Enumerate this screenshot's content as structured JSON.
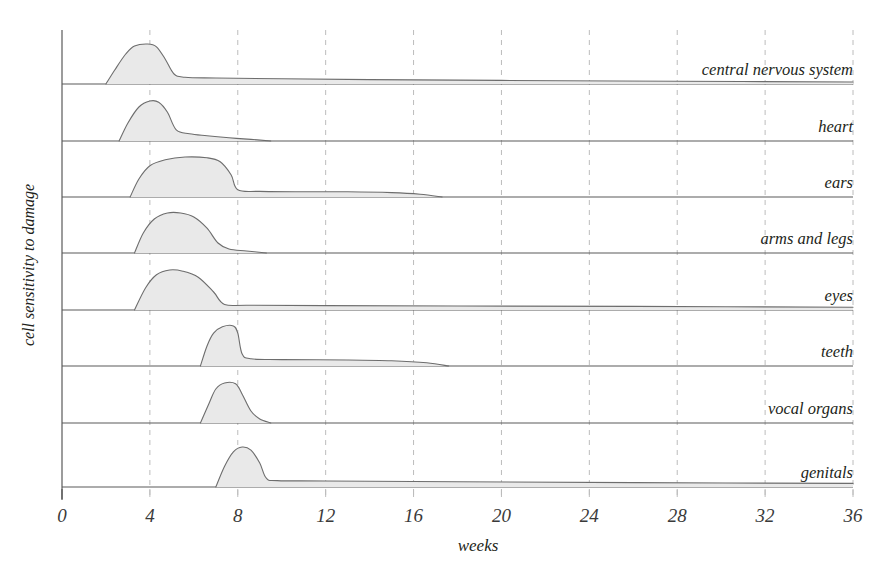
{
  "chart_data": {
    "type": "area",
    "title": "",
    "xlabel": "weeks",
    "ylabel": "cell sensitivity to damage",
    "xlim": [
      0,
      36
    ],
    "xticks": [
      0,
      4,
      8,
      12,
      16,
      20,
      24,
      28,
      32,
      36
    ],
    "xtick_labels": [
      "0",
      "4",
      "8",
      "12",
      "16",
      "20",
      "24",
      "28",
      "32",
      "36"
    ],
    "grid": "vertical dashed gridlines at every x tick",
    "legend": "none; each band is labelled at its right end",
    "ylim": [
      0,
      1
    ],
    "yticks": [],
    "series": [
      {
        "name": "central nervous system",
        "label": "central nervous system",
        "row": 1,
        "onset_week": 2.0,
        "peak_week": 3.6,
        "peak_value": 1.0,
        "drop_week": 5.0,
        "tail_value_at_drop": 0.17,
        "tail_end_week": 36,
        "tail_end_value": 0.05,
        "points": [
          [
            2.0,
            0.0
          ],
          [
            2.4,
            0.35
          ],
          [
            2.9,
            0.75
          ],
          [
            3.3,
            0.95
          ],
          [
            3.9,
            1.0
          ],
          [
            4.3,
            0.93
          ],
          [
            4.7,
            0.62
          ],
          [
            5.1,
            0.25
          ],
          [
            5.6,
            0.17
          ],
          [
            7.0,
            0.15
          ],
          [
            10.0,
            0.13
          ],
          [
            14.0,
            0.11
          ],
          [
            20.0,
            0.09
          ],
          [
            28.0,
            0.07
          ],
          [
            36.0,
            0.05
          ]
        ]
      },
      {
        "name": "heart",
        "label": "heart",
        "row": 2,
        "onset_week": 2.6,
        "peak_week": 4.0,
        "peak_value": 1.0,
        "drop_week": 5.2,
        "tail_value_at_drop": 0.17,
        "tail_end_week": 9.5,
        "tail_end_value": 0.0,
        "points": [
          [
            2.6,
            0.0
          ],
          [
            3.0,
            0.45
          ],
          [
            3.5,
            0.85
          ],
          [
            4.0,
            1.0
          ],
          [
            4.4,
            0.97
          ],
          [
            4.8,
            0.72
          ],
          [
            5.2,
            0.28
          ],
          [
            5.8,
            0.18
          ],
          [
            6.6,
            0.13
          ],
          [
            7.6,
            0.08
          ],
          [
            8.6,
            0.04
          ],
          [
            9.5,
            0.0
          ]
        ]
      },
      {
        "name": "ears",
        "label": "ears",
        "row": 3,
        "onset_week": 3.1,
        "peak_week": 5.8,
        "peak_value": 1.0,
        "drop_week": 8.0,
        "tail_value_at_drop": 0.15,
        "tail_end_week": 17.3,
        "tail_end_value": 0.0,
        "points": [
          [
            3.1,
            0.0
          ],
          [
            3.5,
            0.45
          ],
          [
            4.0,
            0.78
          ],
          [
            4.7,
            0.93
          ],
          [
            5.6,
            1.0
          ],
          [
            6.6,
            0.98
          ],
          [
            7.2,
            0.88
          ],
          [
            7.7,
            0.55
          ],
          [
            8.0,
            0.18
          ],
          [
            9.0,
            0.14
          ],
          [
            11.0,
            0.13
          ],
          [
            13.0,
            0.13
          ],
          [
            15.0,
            0.11
          ],
          [
            16.3,
            0.07
          ],
          [
            17.3,
            0.0
          ]
        ]
      },
      {
        "name": "arms and legs",
        "label": "arms and legs",
        "row": 4,
        "onset_week": 3.3,
        "peak_week": 5.1,
        "peak_value": 1.0,
        "drop_week": 7.4,
        "tail_value_at_drop": 0.1,
        "tail_end_week": 9.3,
        "tail_end_value": 0.0,
        "points": [
          [
            3.3,
            0.0
          ],
          [
            3.7,
            0.5
          ],
          [
            4.2,
            0.85
          ],
          [
            4.8,
            1.0
          ],
          [
            5.4,
            1.0
          ],
          [
            6.0,
            0.9
          ],
          [
            6.6,
            0.62
          ],
          [
            7.1,
            0.25
          ],
          [
            7.6,
            0.1
          ],
          [
            8.4,
            0.05
          ],
          [
            9.3,
            0.0
          ]
        ]
      },
      {
        "name": "eyes",
        "label": "eyes",
        "row": 5,
        "onset_week": 3.3,
        "peak_week": 5.0,
        "peak_value": 1.0,
        "drop_week": 7.4,
        "tail_value_at_drop": 0.12,
        "tail_end_week": 36,
        "tail_end_value": 0.07,
        "points": [
          [
            3.3,
            0.0
          ],
          [
            3.8,
            0.55
          ],
          [
            4.3,
            0.88
          ],
          [
            4.9,
            1.0
          ],
          [
            5.5,
            0.97
          ],
          [
            6.2,
            0.82
          ],
          [
            6.9,
            0.45
          ],
          [
            7.4,
            0.14
          ],
          [
            8.5,
            0.12
          ],
          [
            12.0,
            0.11
          ],
          [
            18.0,
            0.1
          ],
          [
            26.0,
            0.09
          ],
          [
            36.0,
            0.07
          ]
        ]
      },
      {
        "name": "teeth",
        "label": "teeth",
        "row": 6,
        "onset_week": 6.3,
        "peak_week": 7.5,
        "peak_value": 1.0,
        "drop_week": 8.2,
        "tail_value_at_drop": 0.17,
        "tail_end_week": 17.6,
        "tail_end_value": 0.0,
        "points": [
          [
            6.3,
            0.0
          ],
          [
            6.6,
            0.5
          ],
          [
            6.9,
            0.82
          ],
          [
            7.3,
            0.98
          ],
          [
            7.8,
            1.0
          ],
          [
            8.0,
            0.82
          ],
          [
            8.2,
            0.3
          ],
          [
            8.6,
            0.18
          ],
          [
            10.0,
            0.16
          ],
          [
            13.0,
            0.15
          ],
          [
            15.0,
            0.13
          ],
          [
            16.6,
            0.08
          ],
          [
            17.6,
            0.0
          ]
        ]
      },
      {
        "name": "vocal organs",
        "label": "vocal organs",
        "row": 7,
        "onset_week": 6.3,
        "peak_week": 7.5,
        "peak_value": 1.0,
        "drop_week": 8.4,
        "tail_value_at_drop": 0.08,
        "tail_end_week": 9.5,
        "tail_end_value": 0.0,
        "points": [
          [
            6.3,
            0.0
          ],
          [
            6.7,
            0.5
          ],
          [
            7.0,
            0.85
          ],
          [
            7.4,
            1.0
          ],
          [
            7.9,
            0.98
          ],
          [
            8.2,
            0.72
          ],
          [
            8.6,
            0.3
          ],
          [
            9.0,
            0.1
          ],
          [
            9.5,
            0.0
          ]
        ]
      },
      {
        "name": "genitals",
        "label": "genitals",
        "row": 8,
        "onset_week": 7.0,
        "peak_week": 8.1,
        "peak_value": 1.0,
        "drop_week": 9.2,
        "tail_value_at_drop": 0.15,
        "tail_end_week": 36,
        "tail_end_value": 0.09,
        "points": [
          [
            7.0,
            0.0
          ],
          [
            7.4,
            0.52
          ],
          [
            7.8,
            0.88
          ],
          [
            8.2,
            1.0
          ],
          [
            8.6,
            0.92
          ],
          [
            9.0,
            0.6
          ],
          [
            9.3,
            0.22
          ],
          [
            9.8,
            0.16
          ],
          [
            12.0,
            0.15
          ],
          [
            18.0,
            0.13
          ],
          [
            26.0,
            0.11
          ],
          [
            36.0,
            0.09
          ]
        ]
      }
    ]
  },
  "style": {
    "fill_color": "#e9e9e9",
    "curve_stroke": "#6d6d6d",
    "baseline_stroke": "#5a5a5a",
    "grid_color": "#bcbcbc",
    "text_color": "#231f20",
    "background": "#ffffff"
  }
}
